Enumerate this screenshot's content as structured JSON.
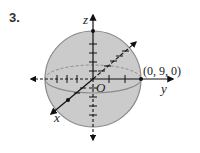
{
  "problem": {
    "number": "3."
  },
  "diagram": {
    "type": "sphere-in-3d-axes",
    "axes": {
      "x_label": "x",
      "y_label": "y",
      "z_label": "z",
      "origin_label": "O"
    },
    "point": {
      "label": "(0, 9, 0)",
      "coords": [
        0,
        9,
        0
      ]
    },
    "colors": {
      "sphere_fill": "#c9c9c9",
      "sphere_edge": "#8a8a8a",
      "axis": "#111111",
      "dashed": "#888888"
    }
  }
}
